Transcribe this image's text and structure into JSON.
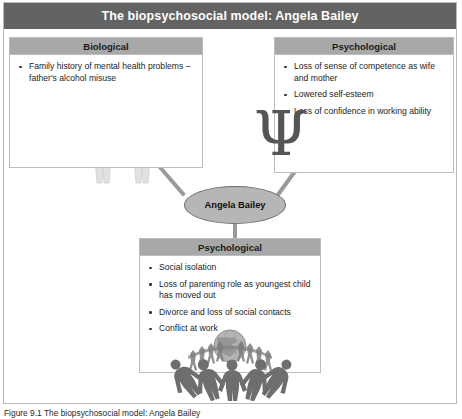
{
  "figure": {
    "title": "The biopsychosocial model: Angela Bailey",
    "central_node_label": "Angela Bailey",
    "caption": "Figure 9.1 The biopsychosocial model: Angela Bailey"
  },
  "panels": {
    "biological": {
      "header": "Biological",
      "bullets": [
        "Family history of mental health problems – father's alcohol misuse"
      ]
    },
    "psychological_top": {
      "header": "Psychological",
      "bullets": [
        "Loss of sense of competence as wife and mother",
        "Lowered self-esteem",
        "Loss of confidence in working ability"
      ]
    },
    "psychological_bottom": {
      "header": "Psychological",
      "bullets": [
        "Social isolation",
        "Loss of parenting role as youngest child has moved out",
        "Divorce and loss of social contacts",
        "Conflict at work"
      ]
    }
  },
  "graphics": {
    "human_pair": "two-human-figures-icon",
    "psi_symbol": "Ψ",
    "globe_people": "globe-with-people-ring-icon"
  },
  "colors": {
    "title_bar": "#636363",
    "panel_header": "#a8a8a8",
    "panel_border": "#bdbdbd",
    "node_fill": "#b6b6b6",
    "connector": "#9a9a9a"
  }
}
